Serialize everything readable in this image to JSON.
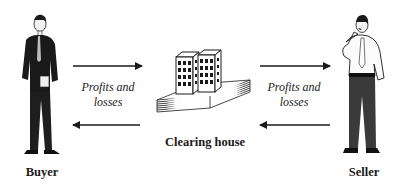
{
  "diagram": {
    "nodes": {
      "buyer": {
        "label": "Buyer",
        "icon": "businessman-standing-icon"
      },
      "clearing_house": {
        "label": "Clearing house",
        "icon": "office-buildings-icon"
      },
      "seller": {
        "label": "Seller",
        "icon": "businessman-thinking-icon"
      }
    },
    "edges": {
      "left": {
        "label_line1": "Profits and",
        "label_line2": "losses"
      },
      "right": {
        "label_line1": "Profits and",
        "label_line2": "losses"
      }
    },
    "colors": {
      "ink": "#1a1a1a",
      "suit": "#222222",
      "trousers": "#3a3a3a",
      "paper": "#ffffff"
    }
  }
}
